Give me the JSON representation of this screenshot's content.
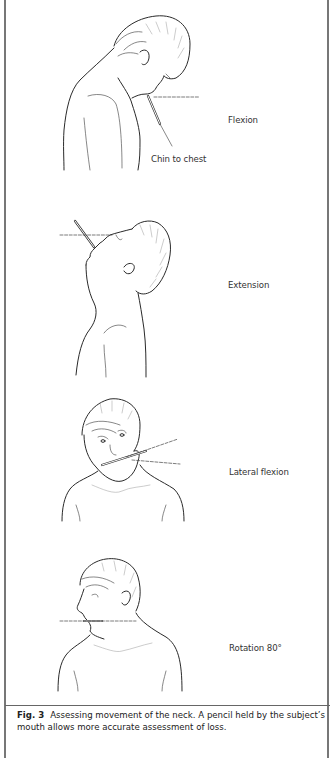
{
  "figure": {
    "panels": [
      {
        "id": "flexion",
        "label": "Flexion",
        "sublabel": "Chin to chest"
      },
      {
        "id": "extension",
        "label": "Extension"
      },
      {
        "id": "lateral-flexion",
        "label": "Lateral flexion"
      },
      {
        "id": "rotation",
        "label": "Rotation 80°"
      }
    ],
    "caption": {
      "number": "Fig. 3",
      "text": "Assessing movement of the neck. A pencil held by the subject’s mouth allows more accurate assessment of loss."
    }
  }
}
